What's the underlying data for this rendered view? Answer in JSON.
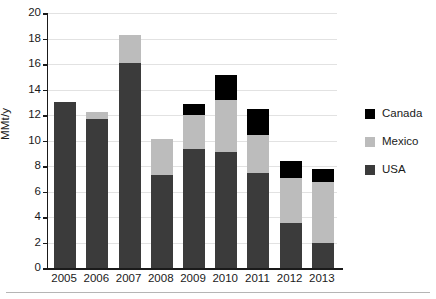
{
  "chart_data": {
    "type": "bar",
    "stacked": true,
    "title": "",
    "xlabel": "",
    "ylabel": "MMt/y",
    "ylim": [
      0,
      20
    ],
    "ytick_step": 2,
    "yticks": [
      0,
      2,
      4,
      6,
      8,
      10,
      12,
      14,
      16,
      18,
      20
    ],
    "ytick_labels": [
      "0",
      "2",
      "4",
      "6",
      "8",
      "10",
      "12",
      "14",
      "16",
      "18",
      "20"
    ],
    "grid": true,
    "grid_axis": "y",
    "legend_position": "right",
    "categories": [
      "2005",
      "2006",
      "2007",
      "2008",
      "2009",
      "2010",
      "2011",
      "2012",
      "2013"
    ],
    "series": [
      {
        "name": "USA",
        "color": "#3b3b3b",
        "values": [
          13.0,
          11.65,
          16.1,
          7.3,
          9.35,
          9.1,
          7.45,
          3.5,
          2.0
        ]
      },
      {
        "name": "Mexico",
        "color": "#bcbcbc",
        "values": [
          0.0,
          0.55,
          2.2,
          2.8,
          2.65,
          4.1,
          2.95,
          3.55,
          4.75
        ]
      },
      {
        "name": "Canada",
        "color": "#000000",
        "values": [
          0.0,
          0.0,
          0.0,
          0.0,
          0.85,
          1.9,
          2.1,
          1.35,
          1.05
        ]
      }
    ],
    "totals": [
      13.0,
      12.2,
      18.3,
      10.1,
      12.85,
      15.1,
      12.5,
      8.4,
      7.8
    ],
    "legend_entries": [
      {
        "label": "Canada",
        "color": "#000000"
      },
      {
        "label": "Mexico",
        "color": "#bcbcbc"
      },
      {
        "label": "USA",
        "color": "#3b3b3b"
      }
    ]
  },
  "colors": {
    "axis": "#1a1a1a",
    "grid": "#e2e2e2",
    "background": "#ffffff",
    "rule": "#b5b5b5"
  }
}
